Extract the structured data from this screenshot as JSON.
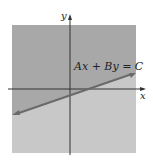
{
  "diagram": {
    "equation_label": "Ax + By = C",
    "x_axis_label": "x",
    "y_axis_label": "y",
    "colors": {
      "upper_region": "#a8a8a8",
      "lower_region": "#c8c8c8",
      "line": "#6a6a6a",
      "axes": "#333333",
      "background": "#ffffff"
    }
  }
}
